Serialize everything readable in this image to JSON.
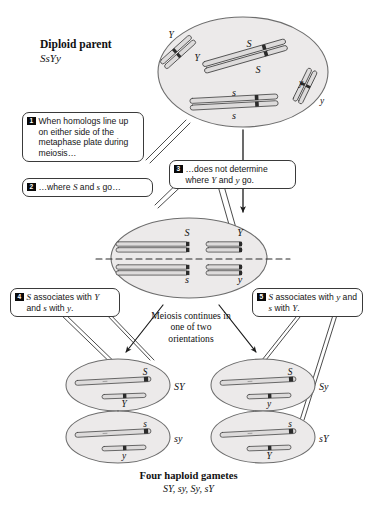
{
  "figure": {
    "domain_type": "biology-diagram",
    "parent": {
      "label": "Diploid parent",
      "genotype": "SsYy",
      "alleles": [
        "Y",
        "Y",
        "S",
        "S",
        "s",
        "s",
        "y",
        "y"
      ]
    },
    "callouts": [
      {
        "number": "1",
        "text": "When homologs line up on either side of the metaphase plate during meiosis…"
      },
      {
        "number": "2",
        "text": "…where S and s go…"
      },
      {
        "number": "3",
        "text": "…does not determine where Y and y go."
      },
      {
        "number": "4",
        "text": "S associates with Y and s with y."
      },
      {
        "number": "5",
        "text": "S associates with y and s with Y."
      }
    ],
    "metaphase": {
      "alleles_top_left": "S",
      "alleles_bottom_left": "s",
      "alleles_top_right": "Y",
      "alleles_bottom_right": "y"
    },
    "meiosis_note": "Meiosis continues in one of two orientations",
    "gametes": [
      {
        "label": "SY",
        "top_allele": "S",
        "bottom_allele": "Y"
      },
      {
        "label": "Sy",
        "top_allele": "S",
        "bottom_allele": "y"
      },
      {
        "label": "sy",
        "top_allele": "s",
        "bottom_allele": "y"
      },
      {
        "label": "sY",
        "top_allele": "s",
        "bottom_allele": "Y"
      }
    ],
    "caption": {
      "title": "Four haploid gametes",
      "subtitle": "SY, sy, Sy, sY"
    },
    "colors": {
      "cell_fill": "#eceaea",
      "cell_stroke": "#6d6d6d",
      "chromatid_fill": "#dddbdb",
      "chromatid_stroke": "#4a4a4a",
      "centromere": "#2b2b2b",
      "badge_bg": "#0a0a0a",
      "text": "#141414"
    }
  }
}
